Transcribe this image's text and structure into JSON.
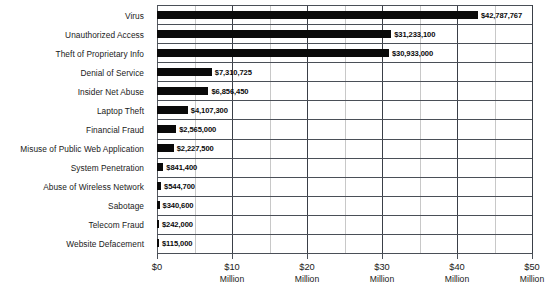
{
  "chart_data": {
    "type": "bar",
    "orientation": "horizontal",
    "title": "",
    "subtitle": "",
    "xlabel": "",
    "ylabel": "",
    "xlim": [
      0,
      50000000
    ],
    "grid": true,
    "legend_position": "none",
    "categories": [
      "Virus",
      "Unauthorized Access",
      "Theft of Proprietary Info",
      "Denial of Service",
      "Insider Net Abuse",
      "Laptop Theft",
      "Financial Fraud",
      "Misuse of Public Web Application",
      "System Penetration",
      "Abuse of Wireless Network",
      "Sabotage",
      "Telecom Fraud",
      "Website Defacement"
    ],
    "values": [
      42787767,
      31233100,
      30933000,
      7310725,
      6856450,
      4107300,
      2565000,
      2227500,
      841400,
      544700,
      340600,
      242000,
      115000
    ],
    "value_labels": [
      "$42,787,767",
      "$31,233,100",
      "$30,933,000",
      "$7,310,725",
      "$6,856,450",
      "$4,107,300",
      "$2,565,000",
      "$2,227,500",
      "$841,400",
      "$544,700",
      "$340,600",
      "$242,000",
      "$115,000"
    ],
    "xtick_values": [
      0,
      10000000,
      20000000,
      30000000,
      40000000,
      50000000
    ],
    "xtick_labels": [
      "$0",
      "$10",
      "$20",
      "$30",
      "$40",
      "$50"
    ],
    "xtick_units": [
      "",
      "Million",
      "Million",
      "Million",
      "Million",
      "Million"
    ],
    "gridline_values": [
      0,
      5000000,
      10000000,
      15000000,
      20000000,
      25000000,
      30000000,
      35000000,
      40000000,
      45000000,
      50000000
    ],
    "colors": {
      "bar": "#0a0a0a",
      "background": "#ffffff",
      "gridline_major": "#3a3f47",
      "gridline_minor": "#c8c8c8",
      "text": "#1a1a1a"
    }
  }
}
